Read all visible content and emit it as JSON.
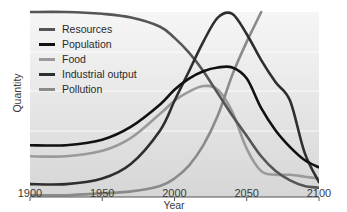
{
  "chart_data": {
    "type": "line",
    "title": "",
    "xlabel": "Year",
    "ylabel": "Quantity",
    "xlim": [
      1900,
      2100
    ],
    "ylim": [
      0,
      100
    ],
    "xticks": [
      1900,
      1950,
      2000,
      2050,
      2100
    ],
    "yticks": [],
    "grid": "horizontal (faint white)",
    "legend_position": "upper left",
    "series": [
      {
        "name": "Resources",
        "color": "#555555",
        "x": [
          1900,
          1925,
          1950,
          1970,
          1990,
          2000,
          2010,
          2020,
          2030,
          2040,
          2050,
          2060,
          2070,
          2080,
          2090,
          2100
        ],
        "values": [
          100,
          100,
          99,
          97,
          92,
          86,
          78,
          68,
          56,
          44,
          33,
          22,
          14,
          9,
          6,
          5
        ]
      },
      {
        "name": "Population",
        "color": "#111111",
        "x": [
          1900,
          1925,
          1950,
          1970,
          1990,
          2000,
          2010,
          2020,
          2030,
          2040,
          2050,
          2060,
          2070,
          2080,
          2090,
          2100
        ],
        "values": [
          28,
          28,
          31,
          38,
          50,
          58,
          64,
          68,
          70,
          70,
          64,
          48,
          36,
          27,
          20,
          16
        ]
      },
      {
        "name": "Food",
        "color": "#9a9a9a",
        "x": [
          1900,
          1925,
          1950,
          1970,
          1990,
          2000,
          2010,
          2020,
          2030,
          2040,
          2050,
          2060,
          2070,
          2080,
          2090,
          2100
        ],
        "values": [
          22,
          22,
          25,
          32,
          45,
          52,
          57,
          60,
          58,
          46,
          26,
          14,
          12,
          12,
          11,
          10
        ]
      },
      {
        "name": "Industrial output",
        "color": "#2e2e2e",
        "x": [
          1900,
          1925,
          1950,
          1970,
          1990,
          2000,
          2010,
          2020,
          2030,
          2040,
          2050,
          2060,
          2070,
          2080,
          2090,
          2100
        ],
        "values": [
          7,
          7,
          10,
          18,
          36,
          52,
          68,
          84,
          97,
          99,
          88,
          74,
          62,
          52,
          24,
          8
        ]
      },
      {
        "name": "Pollution",
        "color": "#8a8a8a",
        "x": [
          1900,
          1925,
          1950,
          1970,
          1990,
          2000,
          2010,
          2020,
          2030,
          2040,
          2050,
          2055,
          2060
        ],
        "values": [
          1,
          1,
          2,
          3,
          6,
          10,
          17,
          28,
          44,
          66,
          84,
          92,
          100
        ]
      }
    ]
  },
  "axes": {
    "x_label": "Year",
    "y_label": "Quantity",
    "x_ticks": [
      "1900",
      "1950",
      "2000",
      "2050",
      "2100"
    ]
  },
  "legend": {
    "items": [
      {
        "label": "Resources",
        "color": "#555555"
      },
      {
        "label": "Population",
        "color": "#111111"
      },
      {
        "label": "Food",
        "color": "#9a9a9a"
      },
      {
        "label": "Industrial output",
        "color": "#2e2e2e"
      },
      {
        "label": "Pollution",
        "color": "#8a8a8a"
      }
    ]
  }
}
